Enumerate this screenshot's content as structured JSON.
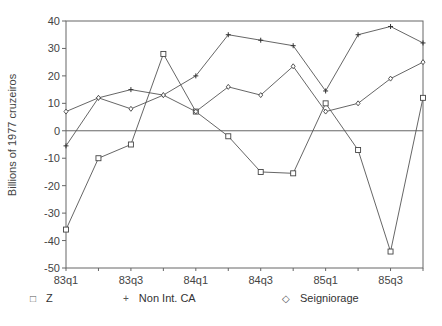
{
  "chart_data": {
    "type": "line",
    "title": "",
    "xlabel": "",
    "ylabel": "Billions of 1977 cruzeiros",
    "ylim": [
      -50,
      40
    ],
    "yticks": [
      40,
      30,
      20,
      10,
      0,
      -10,
      -20,
      -30,
      -40,
      -50
    ],
    "x": [
      "83q1",
      "83q2",
      "83q3",
      "83q4",
      "84q1",
      "84q2",
      "84q3",
      "84q4",
      "85q1",
      "85q2",
      "85q3",
      "85q4"
    ],
    "xtick_labels": [
      "83q1",
      "83q3",
      "84q1",
      "84q3",
      "85q1",
      "85q3"
    ],
    "grid": false,
    "zero_line": true,
    "legend_position": "bottom",
    "series": [
      {
        "name": "Z",
        "marker": "square",
        "values": [
          -36,
          -10,
          -5,
          28,
          7,
          -2,
          -15,
          -15.5,
          10,
          -7,
          -44,
          12
        ]
      },
      {
        "name": "Non Int. CA",
        "marker": "plus",
        "values": [
          -5.5,
          12,
          15,
          13,
          20,
          35,
          33,
          31,
          14.5,
          35,
          38,
          32
        ]
      },
      {
        "name": "Seigniorage",
        "marker": "diamond",
        "values": [
          7,
          12,
          8,
          13,
          7,
          16,
          13,
          23.5,
          7,
          10,
          19,
          25
        ]
      }
    ]
  },
  "legend": {
    "items": [
      {
        "symbol": "□",
        "label": "Z"
      },
      {
        "symbol": "+",
        "label": "Non Int. CA"
      },
      {
        "symbol": "◇",
        "label": "Seigniorage"
      }
    ]
  }
}
